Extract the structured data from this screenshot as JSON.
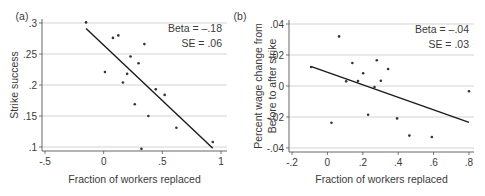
{
  "chart_data": [
    {
      "type": "scatter",
      "panel_label": "(a)",
      "xlabel": "Fraction of workers replaced",
      "ylabel": "Strike success",
      "xlim": [
        -0.5,
        1
      ],
      "ylim": [
        0.1,
        0.3
      ],
      "xticks": [
        -0.5,
        0,
        0.5,
        1
      ],
      "xtick_labels": [
        "-.5",
        "0",
        ".5",
        "1"
      ],
      "yticks": [
        0.1,
        0.15,
        0.2,
        0.25,
        0.3
      ],
      "ytick_labels": [
        ".1",
        ".15",
        ".2",
        ".25",
        ".3"
      ],
      "grid": "horizontal",
      "annotation": [
        "Beta = –.18",
        "SE = .06"
      ],
      "points": [
        [
          -0.15,
          0.301
        ],
        [
          0.079,
          0.276
        ],
        [
          0.125,
          0.28
        ],
        [
          0.347,
          0.266
        ],
        [
          0.229,
          0.246
        ],
        [
          0.297,
          0.235
        ],
        [
          0.011,
          0.221
        ],
        [
          0.2,
          0.218
        ],
        [
          0.164,
          0.204
        ],
        [
          0.444,
          0.193
        ],
        [
          0.52,
          0.184
        ],
        [
          0.265,
          0.169
        ],
        [
          0.381,
          0.15
        ],
        [
          0.62,
          0.131
        ],
        [
          0.93,
          0.108
        ],
        [
          0.322,
          0.097
        ]
      ],
      "fit_line": [
        [
          -0.15,
          0.291
        ],
        [
          0.93,
          0.098
        ]
      ]
    },
    {
      "type": "scatter",
      "panel_label": "(b)",
      "xlabel": "Fraction of workers replaced",
      "ylabel": [
        "Percent wage change from",
        "Before to after strike"
      ],
      "xlim": [
        -0.2,
        0.8
      ],
      "ylim": [
        -0.04,
        0.04
      ],
      "xticks": [
        -0.2,
        0,
        0.2,
        0.4,
        0.6,
        0.8
      ],
      "xtick_labels": [
        "-.2",
        "0",
        ".2",
        ".4",
        ".6",
        ".8"
      ],
      "yticks": [
        -0.04,
        -0.02,
        0,
        0.02,
        0.04
      ],
      "ytick_labels": [
        "-.04",
        "-.02",
        "0",
        ".02",
        ".04"
      ],
      "grid": "horizontal",
      "annotation": [
        "Beta = –.04",
        "SE = .03"
      ],
      "points": [
        [
          -0.092,
          0.0123
        ],
        [
          0.066,
          0.032
        ],
        [
          0.141,
          0.0148
        ],
        [
          0.279,
          0.0166
        ],
        [
          0.343,
          0.011
        ],
        [
          0.202,
          0.0082
        ],
        [
          0.106,
          0.003
        ],
        [
          0.173,
          0.0032
        ],
        [
          0.302,
          0.0034
        ],
        [
          0.266,
          -0.0006
        ],
        [
          0.8,
          -0.0034
        ],
        [
          0.23,
          -0.0185
        ],
        [
          0.394,
          -0.0209
        ],
        [
          0.023,
          -0.0237
        ],
        [
          0.463,
          -0.032
        ],
        [
          0.59,
          -0.0329
        ]
      ],
      "fit_line": [
        [
          -0.09,
          0.0125
        ],
        [
          0.8,
          -0.0235
        ]
      ]
    }
  ],
  "colors": {
    "grid": "#c8c8c8",
    "axis": "#555555",
    "point": "#333333",
    "line": "#1a1a1a",
    "text": "#3a3a3a"
  }
}
